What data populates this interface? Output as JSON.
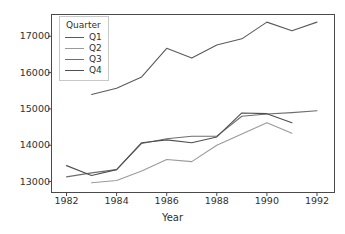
{
  "chart_data": {
    "type": "line",
    "title": "",
    "xlabel": "Year",
    "ylabel": "",
    "xlim": [
      1981.4,
      1992.7
    ],
    "ylim": [
      12700,
      17600
    ],
    "xticks": [
      1982,
      1984,
      1986,
      1988,
      1990,
      1992
    ],
    "yticks": [
      13000,
      14000,
      15000,
      16000,
      17000
    ],
    "grid": false,
    "legend": {
      "title": "Quarter",
      "position": "upper-left",
      "entries": [
        "Q1",
        "Q2",
        "Q3",
        "Q4"
      ]
    },
    "series": [
      {
        "name": "Q1",
        "color": "#5a5a5a",
        "x": [
          1983,
          1984,
          1985,
          1986,
          1987,
          1988,
          1989,
          1990,
          1991,
          1992
        ],
        "values": [
          15400,
          15570,
          15880,
          16670,
          16400,
          16760,
          16930,
          17390,
          17150,
          17390
        ]
      },
      {
        "name": "Q2",
        "color": "#9a9a9a",
        "x": [
          1983,
          1984,
          1985,
          1986,
          1987,
          1988,
          1989,
          1990,
          1991
        ],
        "values": [
          12970,
          13030,
          13290,
          13610,
          13550,
          14000,
          14310,
          14620,
          14330
        ]
      },
      {
        "name": "Q3",
        "color": "#6e6e6e",
        "x": [
          1982,
          1983,
          1984,
          1985,
          1986,
          1987,
          1988,
          1989,
          1990,
          1991,
          1992
        ],
        "values": [
          13130,
          13240,
          13330,
          14050,
          14180,
          14250,
          14250,
          14800,
          14860,
          14900,
          14950
        ]
      },
      {
        "name": "Q4",
        "color": "#4f4f4f",
        "x": [
          1982,
          1983,
          1984,
          1985,
          1986,
          1987,
          1988,
          1989,
          1990,
          1991
        ],
        "values": [
          13440,
          13170,
          13330,
          14070,
          14150,
          14070,
          14230,
          14890,
          14870,
          14620
        ]
      }
    ]
  }
}
